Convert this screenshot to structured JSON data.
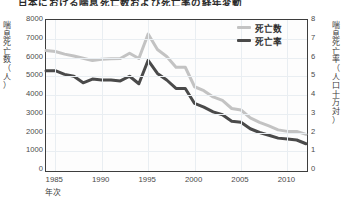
{
  "chart_title": "日本における喘息死亡数および死亡率の経年変動",
  "axes": {
    "x_title": "年次",
    "y_left_title_chars": [
      "喘",
      "息",
      "死",
      "亡",
      "数",
      "（",
      "人",
      "）"
    ],
    "y_right_title_chars": [
      "喘",
      "息",
      "死",
      "亡",
      "率",
      "（",
      "人",
      "口",
      "十",
      "万",
      "対",
      "）"
    ],
    "y_left_ticks": [
      "8000",
      "7000",
      "6000",
      "5000",
      "4000",
      "3000",
      "2000",
      "1000",
      "0"
    ],
    "y_right_ticks": [
      "8",
      "7",
      "6",
      "5",
      "4",
      "3",
      "2",
      "1",
      "0"
    ],
    "x_ticks": [
      "1985",
      "1990",
      "1995",
      "2000",
      "2005",
      "2010"
    ]
  },
  "legend": {
    "position": "top-right",
    "entries": [
      {
        "label": "死亡数",
        "color": "#c3c3c3"
      },
      {
        "label": "死亡率",
        "color": "#4a4a4a"
      }
    ]
  },
  "colors": {
    "deaths_line": "#c3c3c3",
    "rate_line": "#4a4a4a",
    "frame": "#3d3d3d",
    "grid": "#e9eef2",
    "background": "#ffffff",
    "text": "#3a3a3a"
  },
  "chart_data": {
    "type": "line",
    "title": "日本における喘息死亡数および死亡率の経年変動",
    "xlabel": "年次",
    "ylabel": "喘息死亡数（人）",
    "y2label": "喘息死亡率（人口十万対）",
    "grid": true,
    "legend_position": "top-right",
    "x": [
      1984,
      1985,
      1986,
      1987,
      1988,
      1989,
      1990,
      1991,
      1992,
      1993,
      1994,
      1995,
      1996,
      1997,
      1998,
      1999,
      2000,
      2001,
      2002,
      2003,
      2004,
      2005,
      2006,
      2007,
      2008,
      2009,
      2010,
      2011,
      2012
    ],
    "xlim": [
      1984,
      2012
    ],
    "ylim": [
      0,
      8000
    ],
    "y2lim": [
      0,
      8
    ],
    "series": [
      {
        "name": "死亡数",
        "axis": "left",
        "color": "#c3c3c3",
        "unit": "人",
        "values": [
          6370,
          6320,
          6180,
          6080,
          5960,
          5840,
          5910,
          5930,
          5950,
          6230,
          5950,
          7250,
          6430,
          6050,
          5480,
          5480,
          4440,
          4230,
          3900,
          3710,
          3280,
          3200,
          2780,
          2540,
          2350,
          2140,
          2060,
          2060,
          1900
        ]
      },
      {
        "name": "死亡率",
        "axis": "right",
        "color": "#4a4a4a",
        "unit": "人口十万対",
        "values": [
          5.3,
          5.3,
          5.1,
          5.0,
          4.65,
          4.85,
          4.8,
          4.8,
          4.75,
          5.0,
          4.6,
          5.85,
          5.15,
          4.8,
          4.35,
          4.35,
          3.55,
          3.35,
          3.1,
          2.95,
          2.6,
          2.55,
          2.2,
          2.0,
          1.85,
          1.7,
          1.65,
          1.6,
          1.4
        ]
      }
    ],
    "annotations": [
      {
        "text": "peak at 1995",
        "x": 1995,
        "deaths": 7250,
        "rate": 5.85
      }
    ]
  }
}
